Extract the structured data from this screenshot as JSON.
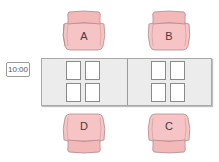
{
  "diagram": {
    "time_badge": "10:00",
    "chairs": [
      {
        "id": "A",
        "label": "A",
        "position": "top-left",
        "facing": "down"
      },
      {
        "id": "B",
        "label": "B",
        "position": "top-right",
        "facing": "down"
      },
      {
        "id": "D",
        "label": "D",
        "position": "bottom-left",
        "facing": "up"
      },
      {
        "id": "C",
        "label": "C",
        "position": "bottom-right",
        "facing": "up"
      }
    ],
    "table": {
      "sections": 2,
      "papers_per_section": 4
    },
    "colors": {
      "chair_fill": "#f6c4c4",
      "chair_outline": "#b58a8a",
      "table_fill": "#ececec",
      "paper_fill": "#ffffff"
    }
  }
}
